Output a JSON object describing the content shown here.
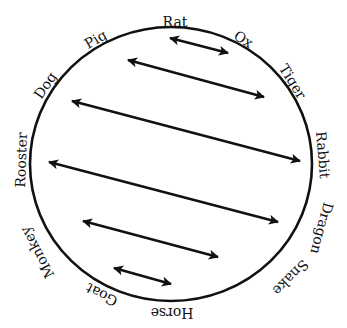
{
  "diagram": {
    "type": "circle-with-chords",
    "stroke_color": "#111111",
    "background": "#ffffff",
    "circle": {
      "cx": 171,
      "cy": 164,
      "rx": 141,
      "ry": 137
    },
    "labels": [
      {
        "name": "Rat",
        "x": 175,
        "y": 23,
        "rotate": 0
      },
      {
        "name": "Ox",
        "x": 243,
        "y": 40,
        "rotate": 32
      },
      {
        "name": "Tiger",
        "x": 292,
        "y": 82,
        "rotate": 58
      },
      {
        "name": "Rabbit",
        "x": 322,
        "y": 155,
        "rotate": 85
      },
      {
        "name": "Dragon",
        "x": 321,
        "y": 228,
        "rotate": 105
      },
      {
        "name": "Snake",
        "x": 290,
        "y": 277,
        "rotate": 135
      },
      {
        "name": "Horse",
        "x": 172,
        "y": 312,
        "rotate": 180
      },
      {
        "name": "Goat",
        "x": 102,
        "y": 294,
        "rotate": -152
      },
      {
        "name": "Monkey",
        "x": 38,
        "y": 252,
        "rotate": -118
      },
      {
        "name": "Rooster",
        "x": 22,
        "y": 160,
        "rotate": -88
      },
      {
        "name": "Dog",
        "x": 46,
        "y": 86,
        "rotate": -56
      },
      {
        "name": "Pig",
        "x": 96,
        "y": 40,
        "rotate": -30
      }
    ],
    "arrows": [
      {
        "from": "Rat",
        "to": "Ox",
        "x1": 170,
        "y1": 38,
        "x2": 228,
        "y2": 53
      },
      {
        "from": "Pig",
        "to": "Tiger",
        "x1": 128,
        "y1": 60,
        "x2": 264,
        "y2": 97
      },
      {
        "from": "Dog",
        "to": "Rabbit",
        "x1": 72,
        "y1": 101,
        "x2": 300,
        "y2": 161
      },
      {
        "from": "Rooster",
        "to": "Dragon",
        "x1": 49,
        "y1": 162,
        "x2": 278,
        "y2": 222
      },
      {
        "from": "Monkey",
        "to": "Snake",
        "x1": 83,
        "y1": 221,
        "x2": 218,
        "y2": 257
      },
      {
        "from": "Goat",
        "to": "Horse",
        "x1": 114,
        "y1": 268,
        "x2": 171,
        "y2": 284
      }
    ]
  }
}
